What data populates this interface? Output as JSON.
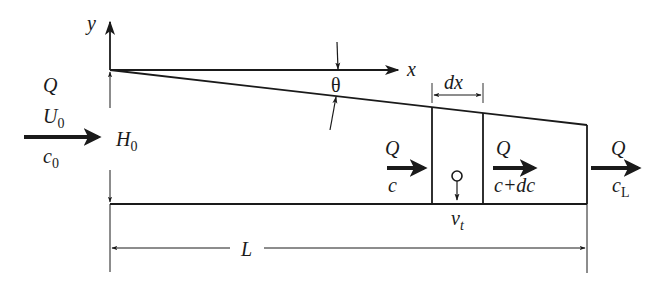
{
  "diagram": {
    "type": "sloped settling channel with control volume",
    "axes": {
      "y_label": "y",
      "x_label": "x",
      "angle_label": "θ"
    },
    "inlet": {
      "flow": "Q",
      "velocity": "U",
      "velocity_sub": "0",
      "concentration": "c",
      "concentration_sub": "0"
    },
    "inlet_height": {
      "label": "H",
      "label_sub": "0"
    },
    "element": {
      "width_label": "dx",
      "settling_velocity": "v",
      "settling_velocity_sub": "t"
    },
    "element_in": {
      "flow": "Q",
      "concentration": "c"
    },
    "element_out": {
      "flow": "Q",
      "concentration": "c+dc"
    },
    "outlet": {
      "flow": "Q",
      "concentration": "c",
      "concentration_sub": "L"
    },
    "length": {
      "label": "L"
    },
    "colors": {
      "line": "#1a1a1a",
      "background": "#ffffff"
    }
  }
}
